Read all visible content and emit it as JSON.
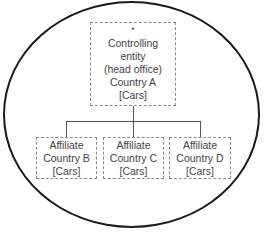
{
  "diagram": {
    "container_shape": "ellipse",
    "head_office": {
      "marker": "*",
      "lines": [
        "Controlling",
        "entity",
        "(head office)",
        "Country A",
        "[Cars]"
      ]
    },
    "affiliates": [
      {
        "lines": [
          "Affiliate",
          "Country B",
          "[Cars]"
        ]
      },
      {
        "lines": [
          "Affiliate",
          "Country C",
          "[Cars]"
        ]
      },
      {
        "lines": [
          "Affiliate",
          "Country D",
          "[Cars]"
        ]
      }
    ],
    "colors": {
      "ellipse_border": "#1a1a1a",
      "box_border": "#8a8a8a",
      "connector": "#555555",
      "text": "#444444"
    }
  }
}
